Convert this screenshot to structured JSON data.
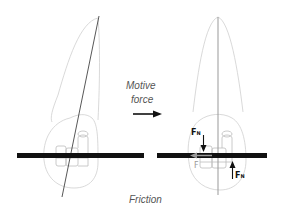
{
  "diagram": {
    "labels": {
      "motive_force_line1": "Motive",
      "motive_force_line2": "force",
      "friction": "Friction",
      "normal_force_top": "F",
      "normal_force_top_sub": "N",
      "normal_force_bottom": "F",
      "normal_force_bottom_sub": "N",
      "friction_force": "F"
    },
    "panels": [
      {
        "name": "before",
        "description": "Tooth with bracket on archwire, tipped axis"
      },
      {
        "name": "after",
        "description": "Tooth upright with normal forces and friction on archwire"
      }
    ],
    "colors": {
      "wire": "#111111",
      "outline": "#c8c8c8",
      "axis_left": "#444444",
      "axis_right": "#999999",
      "text": "#555555",
      "arrow": "#111111",
      "friction_arrow": "#9a9a9a"
    }
  }
}
